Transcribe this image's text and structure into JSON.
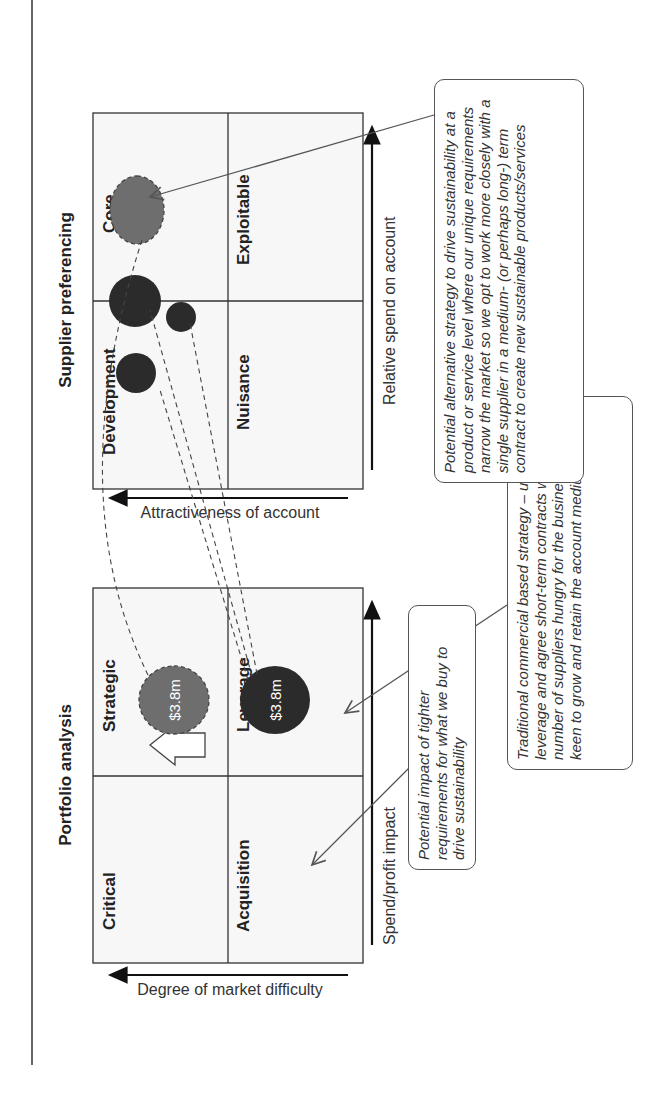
{
  "diagram": {
    "left_panel": {
      "title": "Portfolio analysis",
      "x_axis_label": "Spend/profit impact",
      "y_axis_label": "Degree of market difficulty",
      "quadrants": {
        "top_left": "Critical",
        "top_right": "Strategic",
        "bottom_left": "Acquisition",
        "bottom_right": "Leverage"
      },
      "bubbles": [
        {
          "quadrant": "Strategic",
          "label": "$3.8m",
          "style": "dashed-grey"
        },
        {
          "quadrant": "Leverage",
          "label": "$3.8m",
          "style": "solid-dark"
        }
      ]
    },
    "right_panel": {
      "title": "Supplier preferencing",
      "x_axis_label": "Relative spend on account",
      "y_axis_label": "Attractiveness of account",
      "quadrants": {
        "top_left": "Development",
        "top_right": "Core",
        "bottom_left": "Nuisance",
        "bottom_right": "Exploitable"
      },
      "bubbles": [
        {
          "quadrant": "Development",
          "label": "",
          "style": "solid-dark",
          "size": "large"
        },
        {
          "quadrant": "Development",
          "label": "",
          "style": "solid-dark",
          "size": "medium"
        },
        {
          "quadrant": "Development",
          "label": "",
          "style": "solid-dark",
          "size": "small"
        },
        {
          "quadrant": "Core",
          "label": "",
          "style": "dashed-grey",
          "size": "large"
        }
      ]
    },
    "callouts": {
      "tighter_requirements": "Potential impact of tighter requirements for what we buy to drive sustainability",
      "traditional": "Traditional commercial based strategy – utilize full leverage and agree short-term contracts with a small number of suppliers hungry for the business and keen to grow and retain the account medium term",
      "alternative": "Potential alternative strategy to drive sustainability at a product or service level where our unique requirements narrow the market so we opt to work more closely with a single supplier in a medium- (or perhaps long-) term contract to create new sustainable products/services"
    },
    "colors": {
      "dark_bubble": "#2b2b2b",
      "grey_bubble": "#6e6e6e",
      "grid_line": "#333333",
      "cell_fill": "#f7f7f7"
    }
  }
}
